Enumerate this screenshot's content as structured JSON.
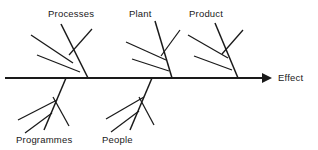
{
  "diagram": {
    "type": "fishbone-ishikawa-cause-and-effect",
    "title": "",
    "background_color": "#ffffff",
    "line_color": "#1a1a1a",
    "effect": {
      "label": "Effect",
      "label_x": 278,
      "label_y": 81
    },
    "spine": {
      "x1": 5,
      "y1": 78,
      "x2": 262,
      "y2": 78,
      "arrow_tip_x": 272,
      "arrow_points": "262,73 272,78 262,83"
    },
    "categories": [
      {
        "id": "processes",
        "label": "Processes",
        "position": "upper",
        "label_x": 48,
        "label_y": 17,
        "bone": {
          "x1": 88,
          "y1": 78,
          "x2": 61,
          "y2": 24
        },
        "sub_bones": [
          {
            "x1": 31,
            "y1": 35,
            "x2": 73,
            "y2": 63
          },
          {
            "x1": 37,
            "y1": 55,
            "x2": 80,
            "y2": 72
          },
          {
            "x1": 92,
            "y1": 29,
            "x2": 69,
            "y2": 55
          }
        ]
      },
      {
        "id": "plant",
        "label": "Plant",
        "position": "upper",
        "label_x": 129,
        "label_y": 17,
        "bone": {
          "x1": 172,
          "y1": 78,
          "x2": 155,
          "y2": 21
        },
        "sub_bones": [
          {
            "x1": 126,
            "y1": 42,
            "x2": 166,
            "y2": 60
          },
          {
            "x1": 132,
            "y1": 59,
            "x2": 169,
            "y2": 71
          },
          {
            "x1": 180,
            "y1": 30,
            "x2": 161,
            "y2": 56
          }
        ]
      },
      {
        "id": "product",
        "label": "Product",
        "position": "upper",
        "label_x": 189,
        "label_y": 17,
        "bone": {
          "x1": 238,
          "y1": 78,
          "x2": 215,
          "y2": 23
        },
        "sub_bones": [
          {
            "x1": 188,
            "y1": 35,
            "x2": 228,
            "y2": 58
          },
          {
            "x1": 194,
            "y1": 56,
            "x2": 232,
            "y2": 70
          },
          {
            "x1": 243,
            "y1": 30,
            "x2": 222,
            "y2": 54
          }
        ]
      },
      {
        "id": "programmes",
        "label": "Programmes",
        "position": "lower",
        "label_x": 16,
        "label_y": 143,
        "bone": {
          "x1": 66,
          "y1": 78,
          "x2": 44,
          "y2": 130
        },
        "sub_bones": [
          {
            "x1": 18,
            "y1": 120,
            "x2": 57,
            "y2": 100
          },
          {
            "x1": 25,
            "y1": 133,
            "x2": 52,
            "y2": 113
          },
          {
            "x1": 69,
            "y1": 126,
            "x2": 53,
            "y2": 97
          }
        ]
      },
      {
        "id": "people",
        "label": "People",
        "position": "lower",
        "label_x": 102,
        "label_y": 143,
        "bone": {
          "x1": 152,
          "y1": 78,
          "x2": 130,
          "y2": 130
        },
        "sub_bones": [
          {
            "x1": 106,
            "y1": 119,
            "x2": 144,
            "y2": 97
          },
          {
            "x1": 111,
            "y1": 132,
            "x2": 139,
            "y2": 111
          },
          {
            "x1": 154,
            "y1": 125,
            "x2": 139,
            "y2": 97
          }
        ]
      }
    ]
  }
}
